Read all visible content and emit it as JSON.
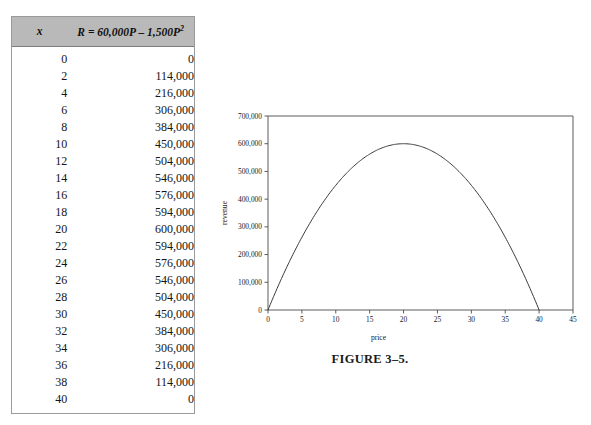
{
  "table": {
    "headers": {
      "x": "x",
      "r_prefix": "R",
      "r_eq": " = 60,000",
      "r_p1": "P",
      "r_minus": " – 1,500",
      "r_p2": "P",
      "r_exp": "2"
    },
    "rows": [
      {
        "x": "0",
        "r": "0"
      },
      {
        "x": "2",
        "r": "114,000"
      },
      {
        "x": "4",
        "r": "216,000"
      },
      {
        "x": "6",
        "r": "306,000"
      },
      {
        "x": "8",
        "r": "384,000"
      },
      {
        "x": "10",
        "r": "450,000"
      },
      {
        "x": "12",
        "r": "504,000"
      },
      {
        "x": "14",
        "r": "546,000"
      },
      {
        "x": "16",
        "r": "576,000"
      },
      {
        "x": "18",
        "r": "594,000"
      },
      {
        "x": "20",
        "r": "600,000"
      },
      {
        "x": "22",
        "r": "594,000"
      },
      {
        "x": "24",
        "r": "576,000"
      },
      {
        "x": "26",
        "r": "546,000"
      },
      {
        "x": "28",
        "r": "504,000"
      },
      {
        "x": "30",
        "r": "450,000"
      },
      {
        "x": "32",
        "r": "384,000"
      },
      {
        "x": "34",
        "r": "306,000"
      },
      {
        "x": "36",
        "r": "216,000"
      },
      {
        "x": "38",
        "r": "114,000"
      },
      {
        "x": "40",
        "r": "0"
      }
    ]
  },
  "figure": {
    "caption": "FIGURE 3–5."
  },
  "chart_data": {
    "type": "line",
    "title": "",
    "xlabel": "price",
    "ylabel": "revenue",
    "xlim": [
      0,
      45
    ],
    "ylim": [
      0,
      700000
    ],
    "grid": false,
    "legend": null,
    "xticks": [
      "0",
      "5",
      "10",
      "15",
      "20",
      "25",
      "30",
      "35",
      "40",
      "45"
    ],
    "xtick_values": [
      0,
      5,
      10,
      15,
      20,
      25,
      30,
      35,
      40,
      45
    ],
    "yticks": [
      "0",
      "100,000",
      "200,000",
      "300,000",
      "400,000",
      "500,000",
      "600,000",
      "700,000"
    ],
    "ytick_values": [
      0,
      100000,
      200000,
      300000,
      400000,
      500000,
      600000,
      700000
    ],
    "equation": "R = 60,000P - 1,500P^2",
    "series": [
      {
        "name": "revenue",
        "color": "#3a3a3a",
        "x": [
          0,
          2,
          4,
          6,
          8,
          10,
          12,
          14,
          16,
          18,
          20,
          22,
          24,
          26,
          28,
          30,
          32,
          34,
          36,
          38,
          40
        ],
        "values": [
          0,
          114000,
          216000,
          306000,
          384000,
          450000,
          504000,
          546000,
          576000,
          594000,
          600000,
          594000,
          576000,
          546000,
          504000,
          450000,
          384000,
          306000,
          216000,
          114000,
          0
        ]
      }
    ]
  }
}
